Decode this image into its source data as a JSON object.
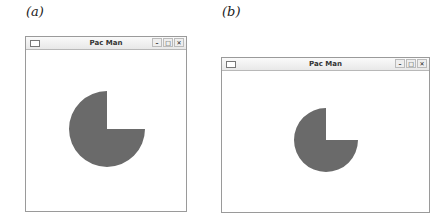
{
  "panels": [
    {
      "label": "(a)",
      "window": {
        "title": "Pac Man",
        "buttons": {
          "minimize": "–",
          "maximize": "□",
          "close": "✕"
        }
      },
      "pacman": {
        "color": "#6a6a6a",
        "mouth": "upper-right quadrant removed"
      }
    },
    {
      "label": "(b)",
      "window": {
        "title": "Pac Man",
        "buttons": {
          "minimize": "–",
          "maximize": "□",
          "close": "✕"
        }
      },
      "pacman": {
        "color": "#6a6a6a",
        "mouth": "upper-right quadrant removed"
      }
    }
  ]
}
